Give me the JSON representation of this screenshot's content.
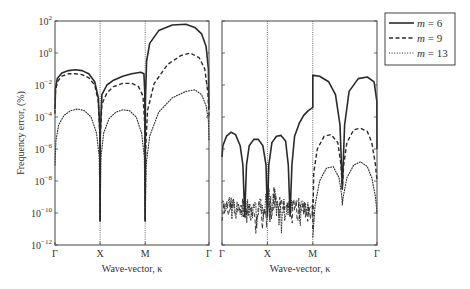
{
  "chart_data": [
    {
      "type": "line",
      "panel": "left",
      "title": "",
      "xlabel": "Wave-vector, κ",
      "ylabel": "Frequency error, (%)",
      "yscale": "log",
      "ylim_exp": [
        -12,
        2
      ],
      "ytick_exponents": [
        2,
        0,
        -2,
        -4,
        -6,
        -8,
        -10,
        -12
      ],
      "xtick_labels": [
        "Γ",
        "X",
        "M",
        "Γ"
      ],
      "xtick_positions": [
        0,
        1,
        2,
        3.414
      ],
      "vertical_lines_at": [
        1,
        2
      ],
      "series": [
        {
          "name": "m = 6",
          "style": "solid",
          "x": [
            0,
            0.01,
            0.05,
            0.15,
            0.3,
            0.45,
            0.6,
            0.75,
            0.88,
            0.96,
            0.995,
            1.0,
            1.005,
            1.04,
            1.15,
            1.3,
            1.5,
            1.7,
            1.9,
            1.97,
            1.99,
            2.0,
            2.005,
            2.03,
            2.1,
            2.3,
            2.6,
            2.9,
            3.1,
            3.25,
            3.35,
            3.4,
            3.414
          ],
          "log10": [
            -3.5,
            -2.2,
            -1.6,
            -1.25,
            -1.1,
            -1.05,
            -1.1,
            -1.3,
            -1.8,
            -2.8,
            -5,
            -10.5,
            -5,
            -2.6,
            -2.0,
            -1.7,
            -1.45,
            -1.3,
            -1.2,
            -1.3,
            -2.5,
            -10.5,
            -3,
            -0.5,
            0.6,
            1.4,
            1.75,
            1.8,
            1.6,
            1.2,
            0.4,
            -1.0,
            -3.5
          ]
        },
        {
          "name": "m = 9",
          "style": "dashed",
          "x": [
            0,
            0.01,
            0.05,
            0.15,
            0.3,
            0.45,
            0.6,
            0.75,
            0.88,
            0.96,
            0.995,
            1.0,
            1.005,
            1.04,
            1.15,
            1.3,
            1.5,
            1.7,
            1.85,
            1.95,
            1.99,
            2.0,
            2.01,
            2.05,
            2.2,
            2.5,
            2.8,
            3.0,
            3.2,
            3.32,
            3.39,
            3.414
          ],
          "log10": [
            -3.8,
            -2.4,
            -1.8,
            -1.45,
            -1.3,
            -1.3,
            -1.35,
            -1.55,
            -2.0,
            -3.0,
            -5.2,
            -10.5,
            -5.2,
            -3.2,
            -2.5,
            -2.1,
            -1.9,
            -1.9,
            -2.1,
            -2.7,
            -4.5,
            -10.5,
            -6,
            -3.6,
            -1.9,
            -0.7,
            -0.15,
            0.0,
            -0.3,
            -1.0,
            -2.5,
            -4.0
          ]
        },
        {
          "name": "m = 13",
          "style": "dotted",
          "x": [
            0,
            0.02,
            0.08,
            0.2,
            0.35,
            0.5,
            0.65,
            0.8,
            0.92,
            0.98,
            1.0,
            1.02,
            1.08,
            1.2,
            1.35,
            1.5,
            1.65,
            1.8,
            1.92,
            1.98,
            2.0,
            2.02,
            2.1,
            2.3,
            2.6,
            2.9,
            3.1,
            3.25,
            3.35,
            3.4,
            3.414
          ],
          "log10": [
            -7.0,
            -5.5,
            -4.5,
            -3.9,
            -3.6,
            -3.5,
            -3.6,
            -4.0,
            -5.0,
            -6.5,
            -10.5,
            -6.5,
            -5.0,
            -4.1,
            -3.7,
            -3.55,
            -3.6,
            -4.0,
            -5.0,
            -6.5,
            -10.5,
            -7,
            -5.2,
            -3.7,
            -2.8,
            -2.4,
            -2.3,
            -2.6,
            -3.3,
            -4.2,
            -5.5
          ]
        }
      ]
    },
    {
      "type": "line",
      "panel": "right",
      "title": "",
      "xlabel": "Wave-vector, κ",
      "ylabel": "",
      "yscale": "log",
      "ylim_exp": [
        -12,
        2
      ],
      "xtick_labels": [
        "Γ",
        "X",
        "M",
        "Γ"
      ],
      "xtick_positions": [
        0,
        1,
        2,
        3.414
      ],
      "vertical_lines_at": [
        1,
        2
      ],
      "series": [
        {
          "name": "m = 6",
          "style": "solid",
          "x": [
            0,
            0.02,
            0.1,
            0.2,
            0.3,
            0.4,
            0.46,
            0.5,
            0.54,
            0.6,
            0.7,
            0.8,
            0.9,
            0.97,
            1.0,
            1.03,
            1.1,
            1.2,
            1.3,
            1.4,
            1.46,
            1.5,
            1.54,
            1.6,
            1.7,
            1.8,
            1.9,
            1.98,
            2.0,
            2.0,
            2.02,
            2.15,
            2.35,
            2.5,
            2.6,
            2.65,
            2.7,
            2.8,
            3.0,
            3.2,
            3.35,
            3.41,
            3.414
          ],
          "log10": [
            -6.5,
            -5.8,
            -5.2,
            -4.95,
            -5.1,
            -5.8,
            -7.0,
            -10.2,
            -7.0,
            -5.8,
            -5.4,
            -5.4,
            -5.8,
            -7.0,
            -10.2,
            -7.0,
            -5.6,
            -5.2,
            -5.15,
            -5.5,
            -7.0,
            -10.2,
            -7.0,
            -5.2,
            -4.4,
            -3.9,
            -3.6,
            -3.45,
            -3.4,
            -1.4,
            -1.4,
            -1.45,
            -1.8,
            -2.6,
            -4.5,
            -8.5,
            -4.5,
            -2.4,
            -1.6,
            -1.5,
            -1.8,
            -3.0,
            -6.0
          ]
        },
        {
          "name": "m = 9",
          "style": "dashed",
          "noise_band_log10": [
            -10.5,
            -9.0
          ],
          "noise_x_range": [
            0,
            2
          ],
          "x": [
            2.0,
            2.02,
            2.1,
            2.25,
            2.4,
            2.55,
            2.62,
            2.65,
            2.68,
            2.75,
            2.9,
            3.05,
            3.2,
            3.3,
            3.38,
            3.414
          ],
          "log10": [
            -11.0,
            -7.5,
            -6.0,
            -5.2,
            -5.1,
            -5.6,
            -7.0,
            -8.5,
            -7.0,
            -5.6,
            -4.8,
            -4.7,
            -4.9,
            -5.6,
            -7.0,
            -8.0
          ]
        },
        {
          "name": "m = 13",
          "style": "dotted",
          "noise_band_log10": [
            -10.5,
            -9.0
          ],
          "noise_x_range": [
            0,
            2
          ],
          "x": [
            2.0,
            2.05,
            2.15,
            2.3,
            2.45,
            2.58,
            2.64,
            2.65,
            2.67,
            2.75,
            2.9,
            3.05,
            3.2,
            3.3,
            3.38,
            3.414
          ],
          "log10": [
            -11.5,
            -9.5,
            -8.0,
            -7.2,
            -7.1,
            -7.8,
            -9.0,
            -9.5,
            -9.0,
            -7.8,
            -7.0,
            -6.8,
            -7.1,
            -7.8,
            -9.0,
            -10.0
          ]
        }
      ]
    }
  ],
  "axes": {
    "ylabel": "Frequency error, (%)",
    "xlabel_left": "Wave-vector, κ",
    "xlabel_right": "Wave-vector, κ",
    "ytick_base": "10",
    "ytick_exponents": [
      "2",
      "0",
      "−2",
      "−4",
      "−6",
      "−8",
      "−10",
      "−12"
    ],
    "xticks": [
      "Γ",
      "X",
      "M",
      "Γ"
    ]
  },
  "legend": {
    "items": [
      {
        "label": "m = 6",
        "m": "m",
        "eq": " = 6",
        "style": "solid"
      },
      {
        "label": "m = 9",
        "m": "m",
        "eq": " = 9",
        "style": "dashed"
      },
      {
        "label": "m = 13",
        "m": "m",
        "eq": " = 13",
        "style": "dotted"
      }
    ]
  },
  "colors": {
    "line": "#2a2a2a",
    "frame": "#444444",
    "text": "#333333"
  }
}
